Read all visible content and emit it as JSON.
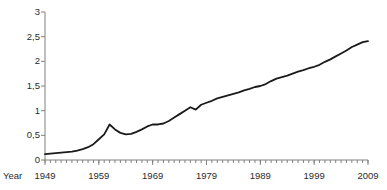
{
  "chart_data": {
    "type": "line",
    "title": "",
    "xlabel": "Year",
    "ylabel": "Million inhabitants",
    "xlim": [
      1949,
      2009
    ],
    "ylim": [
      0,
      3
    ],
    "grid": false,
    "legend": false,
    "y_ticks": [
      0,
      0.5,
      1,
      1.5,
      2,
      2.5,
      3
    ],
    "y_tick_labels": [
      "0",
      "0,5",
      "1",
      "1,5",
      "2",
      "2,5",
      "3"
    ],
    "x_ticks": [
      1949,
      1959,
      1969,
      1979,
      1989,
      1999,
      2009
    ],
    "x_tick_labels": [
      "1949",
      "1959",
      "1969",
      "1979",
      "1989",
      "1999",
      "2009"
    ],
    "x_minor_tick_interval": 1,
    "line_color": "#1a1a1a",
    "line_width": 1.8,
    "axis_color": "#808080",
    "series": [
      {
        "name": "Million inhabitants",
        "x": [
          1949,
          1950,
          1951,
          1952,
          1953,
          1954,
          1955,
          1956,
          1957,
          1958,
          1959,
          1960,
          1961,
          1962,
          1963,
          1964,
          1965,
          1966,
          1967,
          1968,
          1969,
          1970,
          1971,
          1972,
          1973,
          1974,
          1975,
          1976,
          1977,
          1978,
          1979,
          1980,
          1981,
          1982,
          1983,
          1984,
          1985,
          1986,
          1987,
          1988,
          1989,
          1990,
          1991,
          1992,
          1993,
          1994,
          1995,
          1996,
          1997,
          1998,
          1999,
          2000,
          2001,
          2002,
          2003,
          2004,
          2005,
          2006,
          2007,
          2008,
          2009
        ],
        "values": [
          0.12,
          0.13,
          0.14,
          0.15,
          0.16,
          0.17,
          0.19,
          0.22,
          0.26,
          0.32,
          0.42,
          0.52,
          0.72,
          0.62,
          0.55,
          0.52,
          0.53,
          0.57,
          0.62,
          0.68,
          0.72,
          0.72,
          0.74,
          0.79,
          0.86,
          0.93,
          1.0,
          1.07,
          1.02,
          1.12,
          1.16,
          1.2,
          1.25,
          1.28,
          1.31,
          1.34,
          1.37,
          1.41,
          1.44,
          1.48,
          1.5,
          1.54,
          1.6,
          1.65,
          1.68,
          1.71,
          1.75,
          1.79,
          1.82,
          1.86,
          1.89,
          1.93,
          1.99,
          2.04,
          2.1,
          2.16,
          2.22,
          2.29,
          2.34,
          2.39,
          2.41
        ]
      }
    ]
  },
  "plot_geometry": {
    "left": 45,
    "right": 368,
    "top": 12,
    "bottom": 160
  }
}
